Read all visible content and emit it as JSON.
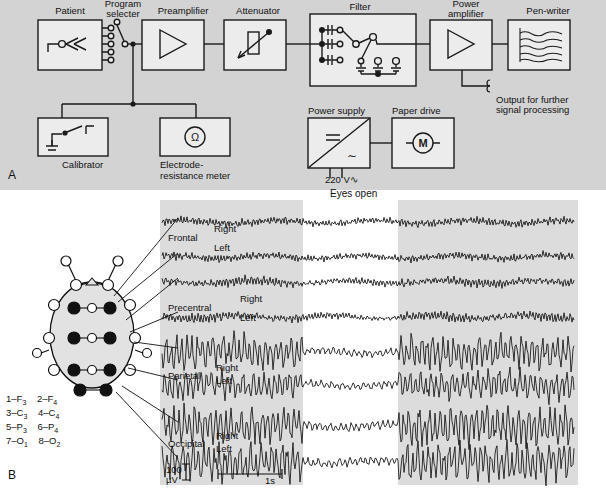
{
  "figure": {
    "panel_a_letter": "A",
    "panel_b_letter": "B"
  },
  "panel_a": {
    "title": "EEG recording system block diagram",
    "blocks": [
      {
        "id": "patient",
        "label": "Patient",
        "icon": "electrode-patient-icon"
      },
      {
        "id": "program-selecter",
        "label": "Program\nselecter",
        "label_line1": "Program",
        "label_line2": "selecter",
        "icon": "rotary-switch-icon"
      },
      {
        "id": "preamplifier",
        "label": "Preamplifier",
        "icon": "triangle-amplifier-icon"
      },
      {
        "id": "attenuator",
        "label": "Attenuator",
        "icon": "potentiometer-icon"
      },
      {
        "id": "filter",
        "label": "Filter",
        "icon": "filter-switch-icon"
      },
      {
        "id": "power-amplifier",
        "label_line1": "Power",
        "label_line2": "amplifier",
        "label": "Power amplifier",
        "icon": "triangle-amplifier-icon"
      },
      {
        "id": "pen-writer",
        "label": "Pen-writer",
        "icon": "chart-trace-icon"
      },
      {
        "id": "calibrator",
        "label": "Calibrator",
        "icon": "battery-switch-icon"
      },
      {
        "id": "electrode-resistance-meter",
        "label_line1": "Electrode-",
        "label_line2": "resistance meter",
        "label": "Electrode-resistance meter",
        "icon": "ohm-meter-icon"
      },
      {
        "id": "power-supply",
        "label": "Power supply",
        "icon": "ac-dc-converter-icon"
      },
      {
        "id": "paper-drive",
        "label": "Paper drive",
        "icon": "motor-icon"
      }
    ],
    "annotations": {
      "output_line1": "Output for further",
      "output_line2": "signal processing",
      "mains": "220 V",
      "mains_symbol": "∿",
      "dc_symbol": "=",
      "ac_symbol": "∼",
      "motor_symbol": "M",
      "ohm_symbol": "Ω"
    }
  },
  "panel_b": {
    "condition_label": "Eyes open",
    "rows": [
      {
        "region": "Frontal",
        "side_top": "Right",
        "side_bottom": "Left"
      },
      {
        "region": "Precentral",
        "side_top": "Right",
        "side_bottom": "Left"
      },
      {
        "region": "Parietal",
        "side_top": "Right",
        "side_bottom": "Left"
      },
      {
        "region": "Occipital",
        "side_top": "Right",
        "side_bottom": "Left"
      }
    ],
    "scale": {
      "amplitude_value": "100",
      "amplitude_unit": "µV",
      "time": "1s"
    },
    "electrode_legend": [
      {
        "num": "1",
        "dash": "–",
        "site": "F",
        "sub": "3"
      },
      {
        "num": "2",
        "dash": "–",
        "site": "F",
        "sub": "4"
      },
      {
        "num": "3",
        "dash": "–",
        "site": "C",
        "sub": "3"
      },
      {
        "num": "4",
        "dash": "–",
        "site": "C",
        "sub": "4"
      },
      {
        "num": "5",
        "dash": "–",
        "site": "P",
        "sub": "3"
      },
      {
        "num": "6",
        "dash": "–",
        "site": "P",
        "sub": "4"
      },
      {
        "num": "7",
        "dash": "–",
        "site": "O",
        "sub": "1"
      },
      {
        "num": "8",
        "dash": "–",
        "site": "O",
        "sub": "2"
      }
    ],
    "head_map": {
      "name": "10-20 electrode placement head diagram",
      "active_electrodes": 8,
      "reference_electrodes": 14
    }
  },
  "chart_data": {
    "type": "line",
    "xlabel": "time",
    "ylabel": "amplitude",
    "x_scale_bar_seconds": 1,
    "y_scale_bar_microvolts": 100,
    "condition_bands": [
      {
        "label": "eyes closed",
        "start_pct": 0,
        "end_pct": 34,
        "shaded": true
      },
      {
        "label": "Eyes open",
        "start_pct": 34,
        "end_pct": 57,
        "shaded": false
      },
      {
        "label": "eyes closed",
        "start_pct": 57,
        "end_pct": 100,
        "shaded": true
      }
    ],
    "series": [
      {
        "name": "Frontal Right",
        "amplitude_closed": 6,
        "amplitude_open": 5,
        "frequency_hz": 18
      },
      {
        "name": "Frontal Left",
        "amplitude_closed": 6,
        "amplitude_open": 5,
        "frequency_hz": 18
      },
      {
        "name": "Precentral Right",
        "amplitude_closed": 7,
        "amplitude_open": 5,
        "frequency_hz": 17
      },
      {
        "name": "Precentral Left",
        "amplitude_closed": 7,
        "amplitude_open": 5,
        "frequency_hz": 17
      },
      {
        "name": "Parietal Right",
        "amplitude_closed": 26,
        "amplitude_open": 6,
        "frequency_hz": 10
      },
      {
        "name": "Parietal Left",
        "amplitude_closed": 22,
        "amplitude_open": 6,
        "frequency_hz": 10
      },
      {
        "name": "Occipital Right",
        "amplitude_closed": 30,
        "amplitude_open": 7,
        "frequency_hz": 10
      },
      {
        "name": "Occipital Left",
        "amplitude_closed": 30,
        "amplitude_open": 7,
        "frequency_hz": 10
      }
    ]
  },
  "colors": {
    "panel_a_background": "#d3d3d3",
    "box_fill": "#ececec",
    "stroke": "#1a1a1a",
    "trace_panel": "#dcdcdc",
    "page": "#ffffff"
  }
}
